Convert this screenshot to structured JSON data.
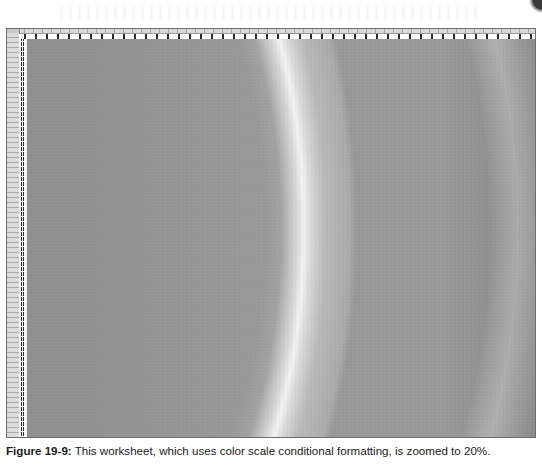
{
  "figure": {
    "caption_label": "Figure 19-9:",
    "caption_text": " This worksheet, which uses color scale conditional formatting, is zoomed to 20%."
  },
  "worksheet": {
    "zoom_level": "20%",
    "formatting": "color scale conditional formatting",
    "color_scale": {
      "low_color": "#8c8c8c",
      "mid_color": "#b4b4b4",
      "high_color": "#ffffff"
    },
    "header_row_label": "1",
    "header_col_label": "A",
    "row_header_labels": [
      "1",
      "2",
      "3",
      "4",
      "5",
      "6",
      "7",
      "8",
      "9",
      "10",
      "11",
      "12",
      "13",
      "14",
      "15",
      "16",
      "17",
      "18",
      "19",
      "20"
    ],
    "column_a_values": [
      "0.1",
      "0.2",
      "0.3",
      "0.4",
      "0.5",
      "0.6",
      "0.7",
      "0.8",
      "0.9",
      "1",
      "1.1",
      "1.2",
      "1.3",
      "1.4",
      "1.5",
      "1.6",
      "1.7",
      "1.8",
      "1.9",
      "2"
    ]
  }
}
